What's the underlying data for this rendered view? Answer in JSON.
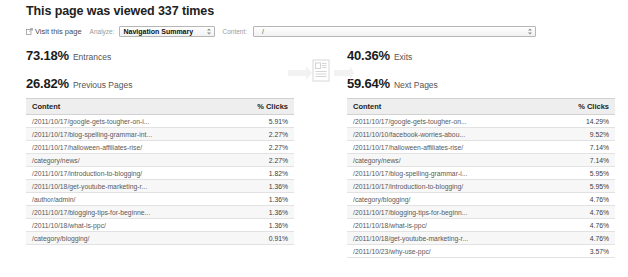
{
  "header": {
    "title": "This page was viewed 337 times",
    "visit_link_label": "Visit this page",
    "visit_link_icon": "external-link-icon",
    "analyze_label": "Analyze:",
    "analyze_value": "Navigation Summary",
    "content_label": "Content:",
    "content_value": "/"
  },
  "center": {
    "icon": "page-document-flow-icon"
  },
  "stats": {
    "entrances": {
      "value": "73.18%",
      "label": "Entrances"
    },
    "previous_pages": {
      "value": "26.82%",
      "label": "Previous Pages"
    },
    "exits": {
      "value": "40.36%",
      "label": "Exits"
    },
    "next_pages": {
      "value": "59.64%",
      "label": "Next Pages"
    }
  },
  "tables": {
    "columns": {
      "content": "Content",
      "clicks": "% Clicks"
    },
    "previous_pages": [
      {
        "content": "/2011/10/17/google-gets-tougher-on-i...",
        "clicks": "5.91%"
      },
      {
        "content": "/2011/10/17/blog-spelling-grammar-int...",
        "clicks": "2.27%"
      },
      {
        "content": "/2011/10/17/halloween-affiliates-rise/",
        "clicks": "2.27%"
      },
      {
        "content": "/category/news/",
        "clicks": "2.27%"
      },
      {
        "content": "/2011/10/17/introduction-to-blogging/",
        "clicks": "1.82%"
      },
      {
        "content": "/2011/10/18/get-youtube-marketing-r...",
        "clicks": "1.36%"
      },
      {
        "content": "/author/admin/",
        "clicks": "1.36%"
      },
      {
        "content": "/2011/10/17/blogging-tips-for-beginne...",
        "clicks": "1.36%"
      },
      {
        "content": "/2011/10/18/what-is-ppc/",
        "clicks": "1.36%"
      },
      {
        "content": "/category/blogging/",
        "clicks": "0.91%"
      }
    ],
    "next_pages": [
      {
        "content": "/2011/10/17/google-gets-tougher-on...",
        "clicks": "14.29%"
      },
      {
        "content": "/2011/10/10/facebook-worries-abou...",
        "clicks": "9.52%"
      },
      {
        "content": "/2011/10/17/halloween-affiliates-rise/",
        "clicks": "7.14%"
      },
      {
        "content": "/category/news/",
        "clicks": "7.14%"
      },
      {
        "content": "/2011/10/17/blog-spelling-grammar-i...",
        "clicks": "5.95%"
      },
      {
        "content": "/2011/10/17/introduction-to-blogging/",
        "clicks": "5.95%"
      },
      {
        "content": "/category/blogging/",
        "clicks": "4.76%"
      },
      {
        "content": "/2011/10/17/blogging-tips-for-beginn...",
        "clicks": "4.76%"
      },
      {
        "content": "/2011/10/18/what-is-ppc/",
        "clicks": "4.76%"
      },
      {
        "content": "/2011/10/18/get-youtube-marketing-r...",
        "clicks": "4.76%"
      },
      {
        "content": "/2011/10/23/why-use-ppc/",
        "clicks": "3.57%"
      }
    ]
  }
}
